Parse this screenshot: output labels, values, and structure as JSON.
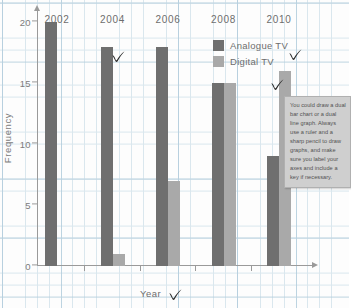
{
  "chart_data": {
    "type": "bar",
    "title": "",
    "subtitle": "",
    "xlabel": "Year",
    "ylabel": "Frequency",
    "categories": [
      "2002",
      "2004",
      "2006",
      "2008",
      "2010"
    ],
    "series": [
      {
        "name": "Analogue TV",
        "color": "#6f6f6f",
        "values": [
          20,
          18,
          18,
          15,
          9
        ]
      },
      {
        "name": "Digital TV",
        "color": "#a9a9a9",
        "values": [
          0,
          1,
          7,
          15,
          16
        ]
      }
    ],
    "ylim": [
      0,
      21
    ],
    "yticks": [
      0,
      5,
      10,
      15,
      20
    ],
    "ytick_labels": [
      "0",
      "5",
      "10",
      "15",
      "20"
    ],
    "grid": true,
    "grid_style": "graph-paper",
    "legend_position": "top-right"
  },
  "legend": {
    "items": [
      {
        "label": "Analogue TV",
        "color": "#6f6f6f"
      },
      {
        "label": "Digital TV",
        "color": "#a9a9a9"
      }
    ]
  },
  "note": {
    "text": "You could draw a dual bar chart or a dual line graph. Always use a ruler and a sharp pencil to draw graphs, and make sure you label your axes and include a key if necessary."
  },
  "annotations": {
    "checkmarks": [
      {
        "name": "checkmark-2004-bar",
        "x": 111,
        "y": 50
      },
      {
        "name": "checkmark-legend",
        "x": 288,
        "y": 48
      },
      {
        "name": "checkmark-2010-bar",
        "x": 270,
        "y": 78
      },
      {
        "name": "checkmark-year-label",
        "x": 168,
        "y": 288
      }
    ]
  },
  "colors": {
    "analogue": "#6f6f6f",
    "digital": "#a9a9a9",
    "axis": "#9a9a9a",
    "grid_minor": "#cfe0ea",
    "grid_major": "#b3cddd",
    "note_bg": "#cfcfcf",
    "ink": "#2b2b2b"
  }
}
